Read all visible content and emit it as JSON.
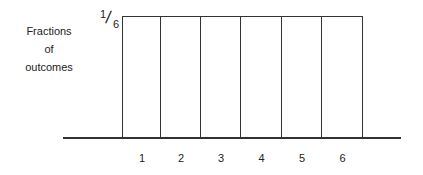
{
  "chart_data": {
    "type": "bar",
    "title": "",
    "xlabel": "",
    "ylabel": "Fractions of outcomes",
    "categories": [
      "1",
      "2",
      "3",
      "4",
      "5",
      "6"
    ],
    "values": [
      0.1667,
      0.1667,
      0.1667,
      0.1667,
      0.1667,
      0.1667
    ],
    "y_tick_labels": [
      "1/6"
    ],
    "ylim": [
      0,
      0.1667
    ],
    "grid": false,
    "legend": null
  },
  "labels": {
    "ylabel_lines": [
      "Fractions",
      "of",
      "outcomes"
    ],
    "frac_num": "1",
    "frac_slash": "/",
    "frac_den": "6"
  }
}
